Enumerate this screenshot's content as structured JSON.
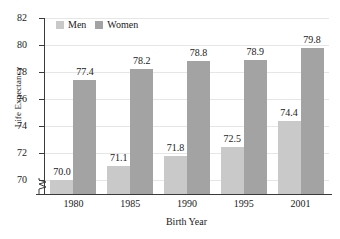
{
  "chart_data": {
    "type": "bar",
    "title": "",
    "xlabel": "Birth Year",
    "ylabel": "Life Expectancy",
    "categories": [
      "1980",
      "1985",
      "1990",
      "1995",
      "2001"
    ],
    "series": [
      {
        "name": "Men",
        "color": "#c9c9c9",
        "values": [
          70.0,
          71.1,
          71.8,
          72.5,
          74.4
        ],
        "labels": [
          "70.0",
          "71.1",
          "71.8",
          "72.5",
          "74.4"
        ]
      },
      {
        "name": "Women",
        "color": "#a3a3a3",
        "values": [
          77.4,
          78.2,
          78.8,
          78.9,
          79.8
        ],
        "labels": [
          "77.4",
          "78.2",
          "78.8",
          "78.9",
          "79.8"
        ]
      }
    ],
    "ylim": [
      69.0,
      82.0
    ],
    "yticks": [
      70,
      72,
      74,
      76,
      78,
      80,
      82
    ],
    "ytick_labels": [
      "70",
      "72",
      "74",
      "76",
      "78",
      "80",
      "82"
    ],
    "grid": true,
    "y_axis_broken": true,
    "legend_position": "top-left"
  },
  "axes": {
    "y_title": "Life Expectancy",
    "x_title": "Birth Year"
  },
  "legend": {
    "items": [
      {
        "label": "Men",
        "color": "#c9c9c9"
      },
      {
        "label": "Women",
        "color": "#a3a3a3"
      }
    ]
  },
  "yticks": [
    {
      "label": "82"
    },
    {
      "label": "80"
    },
    {
      "label": "78"
    },
    {
      "label": "76"
    },
    {
      "label": "74"
    },
    {
      "label": "72"
    },
    {
      "label": "70"
    }
  ],
  "xticks": [
    {
      "label": "1980"
    },
    {
      "label": "1985"
    },
    {
      "label": "1990"
    },
    {
      "label": "1995"
    },
    {
      "label": "2001"
    }
  ],
  "bar_labels": {
    "men": [
      "70.0",
      "71.1",
      "71.8",
      "72.5",
      "74.4"
    ],
    "women": [
      "77.4",
      "78.2",
      "78.8",
      "78.9",
      "79.8"
    ]
  },
  "colors": {
    "men": "#c9c9c9",
    "women": "#a3a3a3",
    "axis": "#3a3a3a",
    "grid": "#e6e6e6",
    "background": "#ffffff"
  }
}
